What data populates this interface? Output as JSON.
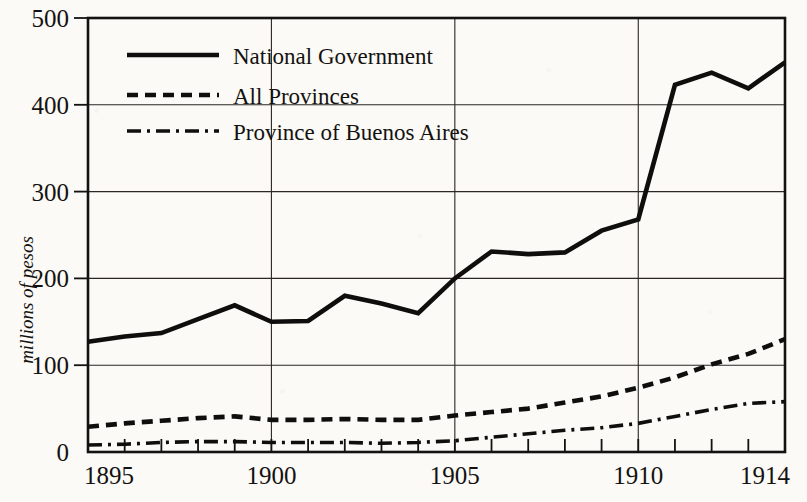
{
  "chart_data": {
    "type": "line",
    "title": "",
    "subtitle": "",
    "xlabel": "",
    "ylabel": "millions of pesos",
    "xlim": [
      1895,
      1914
    ],
    "ylim": [
      0,
      500
    ],
    "grid": true,
    "legend_position": "top-left inside plot area",
    "y_ticks": [
      0,
      100,
      200,
      300,
      400,
      500
    ],
    "y_tick_labels": [
      "0",
      "100",
      "200",
      "300",
      "400",
      "500"
    ],
    "x_ticks": [
      1895,
      1896,
      1897,
      1898,
      1899,
      1900,
      1901,
      1902,
      1903,
      1904,
      1905,
      1906,
      1907,
      1908,
      1909,
      1910,
      1911,
      1912,
      1913,
      1914
    ],
    "x_tick_labels_shown": [
      "1895",
      "1900",
      "1905",
      "1910",
      "1914"
    ],
    "x_gridlines_at": [
      1900,
      1905,
      1910
    ],
    "x": [
      1895,
      1896,
      1897,
      1898,
      1899,
      1900,
      1901,
      1902,
      1903,
      1904,
      1905,
      1906,
      1907,
      1908,
      1909,
      1910,
      1911,
      1912,
      1913,
      1914
    ],
    "series": [
      {
        "name": "National Government",
        "style": "solid",
        "values": [
          127,
          133,
          137,
          153,
          169,
          150,
          151,
          180,
          171,
          160,
          200,
          231,
          228,
          230,
          255,
          268,
          423,
          437,
          419,
          449
        ]
      },
      {
        "name": "All Provinces",
        "style": "dashed",
        "values": [
          29,
          33,
          36,
          39,
          41,
          37,
          37,
          38,
          37,
          37,
          42,
          46,
          50,
          57,
          64,
          74,
          86,
          101,
          113,
          130
        ]
      },
      {
        "name": "Province of Buenos Aires",
        "style": "dash-dot",
        "values": [
          8,
          9,
          11,
          12,
          12,
          11,
          11,
          11,
          10,
          11,
          13,
          17,
          21,
          25,
          28,
          33,
          41,
          49,
          56,
          58
        ]
      }
    ]
  },
  "legend": {
    "items": [
      {
        "label": "National Government",
        "style": "solid"
      },
      {
        "label": "All Provinces",
        "style": "dashed"
      },
      {
        "label": "Province of Buenos Aires",
        "style": "dash-dot"
      }
    ]
  },
  "colors": {
    "ink": "#141210",
    "line": "#100e0c",
    "grid": "#2a2724",
    "background": "#fbfaf7"
  }
}
